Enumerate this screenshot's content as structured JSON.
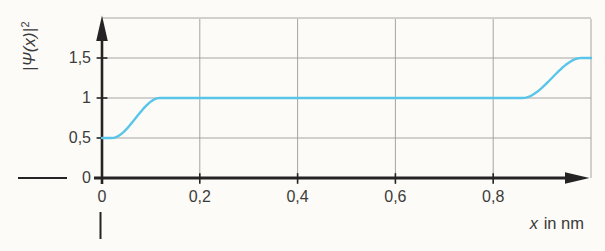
{
  "chart_data": {
    "type": "line",
    "title": "",
    "x_axis": {
      "label": "x in nm",
      "label_var": "x",
      "label_rest": " in nm",
      "range": [
        0,
        1.0
      ],
      "ticks": [
        0,
        0.2,
        0.4,
        0.6,
        0.8
      ],
      "tick_labels": [
        "0",
        "0,2",
        "0,4",
        "0,6",
        "0,8"
      ]
    },
    "y_axis": {
      "label": "|Ψ(x)|²",
      "label_main": "|Ψ(x)|",
      "label_sup": "2",
      "range": [
        0,
        2
      ],
      "ticks": [
        0.5,
        1,
        1.5
      ],
      "tick_labels": [
        "0,5",
        "1",
        "1,5"
      ],
      "zero_label": "0"
    },
    "grid": true,
    "legend": false,
    "series": [
      {
        "name": "probability density |Ψ(x)|²",
        "color": "#58c5e9",
        "key_points": [
          [
            0,
            0.5
          ],
          [
            0.115,
            1.0
          ],
          [
            0.86,
            1.0
          ],
          [
            0.98,
            1.5
          ],
          [
            1.0,
            1.5
          ]
        ],
        "segments": [
          {
            "type": "flat",
            "x0": 0.0,
            "x1": 0.02,
            "y": 0.5
          },
          {
            "type": "smoothstep",
            "x0": 0.02,
            "x1": 0.118,
            "y0": 0.5,
            "y1": 1.0
          },
          {
            "type": "flat",
            "x0": 0.118,
            "x1": 0.86,
            "y": 1.0
          },
          {
            "type": "smoothstep",
            "x0": 0.86,
            "x1": 0.98,
            "y0": 1.0,
            "y1": 1.5
          },
          {
            "type": "flat",
            "x0": 0.98,
            "x1": 1.0,
            "y": 1.5
          }
        ]
      }
    ],
    "colors": {
      "curve": "#58c5e9",
      "grid": "#9b9b9b",
      "axis": "#242424",
      "text": "#3a3a3a",
      "background": "#fcfbf7"
    }
  }
}
